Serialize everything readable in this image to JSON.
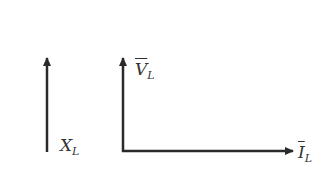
{
  "diagram": {
    "type": "phasor-diagram",
    "colors": {
      "line": "#2a2a2a",
      "text": "#333333"
    },
    "labels": {
      "reactance": {
        "main": "X",
        "sub": "L"
      },
      "voltage": {
        "main": "V",
        "sub": "L",
        "overline": true
      },
      "current": {
        "main": "I",
        "sub": "L",
        "overline": true
      }
    }
  }
}
